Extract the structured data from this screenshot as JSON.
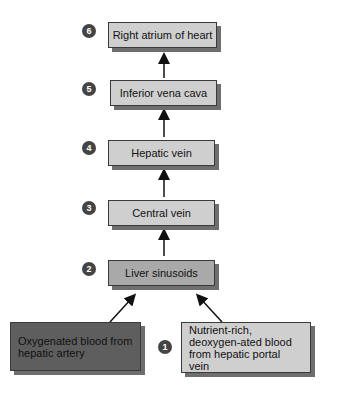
{
  "diagram": {
    "steps": [
      {
        "number": "6",
        "label": "Right atrium of heart"
      },
      {
        "number": "5",
        "label": "Inferior vena cava"
      },
      {
        "number": "4",
        "label": "Hepatic vein"
      },
      {
        "number": "3",
        "label": "Central vein"
      },
      {
        "number": "2",
        "label": "Liver sinusoids"
      }
    ],
    "sources": {
      "number": "1",
      "left": "Oxygenated blood from hepatic artery",
      "right": "Nutrient-rich, deoxygen-ated blood from hepatic portal vein"
    }
  },
  "colors": {
    "light_box": "#cfcfcf",
    "sinusoid_box": "#a9a9a9",
    "dark_box": "#5e5e5e",
    "badge": "#444444"
  }
}
